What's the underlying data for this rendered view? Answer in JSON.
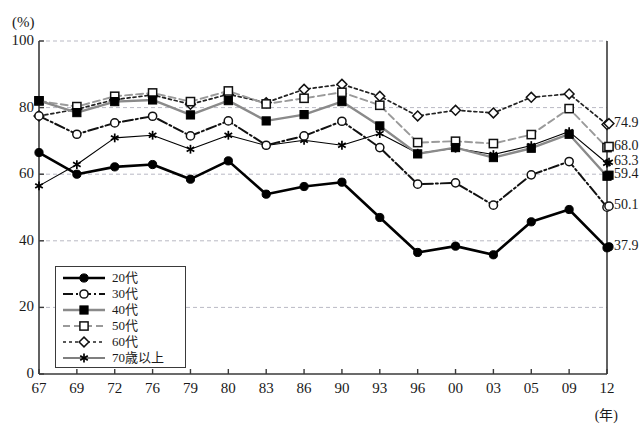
{
  "chart_data": {
    "type": "line",
    "title": "",
    "xlabel": "(年)",
    "ylabel": "(%)",
    "ylim": [
      0,
      100
    ],
    "yticks": [
      0,
      20,
      40,
      60,
      80,
      100
    ],
    "grid": true,
    "legend_position": "inside-bottom-left",
    "categories": [
      "67",
      "69",
      "72",
      "76",
      "79",
      "80",
      "83",
      "86",
      "90",
      "93",
      "96",
      "00",
      "03",
      "05",
      "09",
      "12"
    ],
    "series": [
      {
        "name": "20代",
        "marker": "filled-circle",
        "line": "solid-thick",
        "color": "#000000",
        "end_label": "37.9",
        "values": [
          66.5,
          60.0,
          62.2,
          62.9,
          58.5,
          64.0,
          54.0,
          56.3,
          57.6,
          47.0,
          36.5,
          38.4,
          35.8,
          45.7,
          49.4,
          37.9
        ]
      },
      {
        "name": "30代",
        "marker": "open-circle",
        "line": "dash-dot",
        "color": "#111111",
        "end_label": "50.1",
        "values": [
          77.5,
          72.0,
          75.4,
          77.4,
          71.5,
          76.0,
          68.7,
          71.5,
          75.9,
          68.0,
          57.0,
          57.4,
          50.7,
          59.8,
          63.8,
          50.1
        ]
      },
      {
        "name": "40代",
        "marker": "filled-square",
        "line": "solid-gray",
        "color": "#8a8a8a",
        "end_label": "59.4",
        "values": [
          82.1,
          78.5,
          81.8,
          82.3,
          77.8,
          82.1,
          76.0,
          77.9,
          81.8,
          74.5,
          66.1,
          68.0,
          65.0,
          67.8,
          72.0,
          59.4
        ]
      },
      {
        "name": "50代",
        "marker": "open-square",
        "line": "dashed-gray",
        "color": "#9a9a9a",
        "end_label": "68.0",
        "values": [
          82.0,
          80.3,
          83.4,
          84.4,
          81.8,
          85.0,
          81.1,
          82.8,
          84.6,
          80.7,
          69.5,
          69.9,
          69.2,
          71.9,
          79.7,
          68.0
        ]
      },
      {
        "name": "60代",
        "marker": "open-diamond",
        "line": "dotted",
        "color": "#222222",
        "end_label": "74.9",
        "values": [
          77.5,
          79.5,
          82.4,
          83.8,
          81.0,
          84.0,
          81.5,
          85.5,
          87.0,
          83.4,
          77.5,
          79.2,
          78.4,
          83.1,
          84.1,
          74.9
        ]
      },
      {
        "name": "70歳以上",
        "marker": "asterisk",
        "line": "solid-thin",
        "color": "#000000",
        "end_label": "63.3",
        "values": [
          56.5,
          62.9,
          70.9,
          71.7,
          67.5,
          71.7,
          68.6,
          70.2,
          68.7,
          72.2,
          66.3,
          67.8,
          65.9,
          68.6,
          72.8,
          63.3
        ]
      }
    ]
  }
}
